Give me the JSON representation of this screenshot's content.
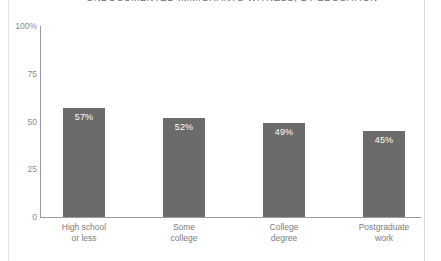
{
  "chart_data": {
    "type": "bar",
    "title": "UNDOCUMENTED IMMIGRANTS WITNESS, BY EDUCATION",
    "xlabel": "",
    "ylabel": "",
    "ylim": [
      0,
      100
    ],
    "grid": false,
    "legend": "none",
    "y_ticks": [
      {
        "value": 100,
        "label": "100%"
      },
      {
        "value": 75,
        "label": "75"
      },
      {
        "value": 50,
        "label": "50"
      },
      {
        "value": 25,
        "label": "25"
      },
      {
        "value": 0,
        "label": "0"
      }
    ],
    "categories": [
      "High school or less",
      "Some college",
      "College degree",
      "Postgraduate work"
    ],
    "category_lines": [
      [
        "High school",
        "or less"
      ],
      [
        "Some",
        "college"
      ],
      [
        "College",
        "degree"
      ],
      [
        "Postgraduate",
        "work"
      ]
    ],
    "values": [
      57,
      52,
      49,
      45
    ],
    "value_labels": [
      "57%",
      "52%",
      "49%",
      "45%"
    ],
    "bar_color": "#6b6b6b",
    "value_label_color": "#ffffff",
    "axis_color": "#9a9a9a",
    "tick_label_color": "#8c8c8c"
  }
}
